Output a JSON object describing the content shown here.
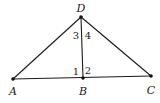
{
  "diagram": {
    "type": "geometry",
    "points": {
      "D": {
        "label": "D",
        "x": 81,
        "y": 17,
        "label_x": 81,
        "label_y": 12
      },
      "A": {
        "label": "A",
        "x": 13,
        "y": 79,
        "label_x": 13,
        "label_y": 95
      },
      "B": {
        "label": "B",
        "x": 83,
        "y": 78,
        "label_x": 83,
        "label_y": 95
      },
      "C": {
        "label": "C",
        "x": 151,
        "y": 76,
        "label_x": 151,
        "label_y": 94
      }
    },
    "segments": [
      [
        "A",
        "D"
      ],
      [
        "D",
        "C"
      ],
      [
        "A",
        "C"
      ],
      [
        "D",
        "B"
      ]
    ],
    "angle_labels": [
      {
        "label": "3",
        "x": 76,
        "y": 39
      },
      {
        "label": "4",
        "x": 88,
        "y": 39
      },
      {
        "label": "1",
        "x": 76,
        "y": 75
      },
      {
        "label": "2",
        "x": 88,
        "y": 74
      }
    ]
  }
}
